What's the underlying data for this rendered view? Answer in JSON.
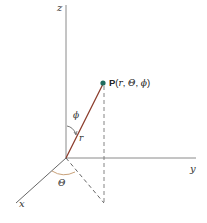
{
  "diagram": {
    "type": "spherical-coordinates",
    "axes": {
      "z_label": "z",
      "y_label": "y",
      "x_label": "x"
    },
    "point": {
      "name": "P",
      "coords_open": "(",
      "r": "r",
      "sep1": ", ",
      "theta": "Θ",
      "sep2": ", ",
      "phi": "ϕ",
      "coords_close": ")"
    },
    "radius_label": "r",
    "polar_angle_label": "ϕ",
    "azimuth_angle_label": "Θ",
    "colors": {
      "axis": "#8a8a8a",
      "radius_line": "#8b3a2a",
      "point": "#1f6b5e",
      "angle_arc": "#c9a27a",
      "dashed": "#777777"
    }
  }
}
